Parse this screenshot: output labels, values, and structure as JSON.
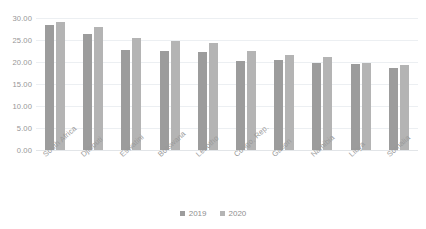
{
  "chart_data": {
    "type": "bar",
    "title": "",
    "xlabel": "",
    "ylabel": "",
    "ylim": [
      0,
      30
    ],
    "ytick_labels": [
      "30.00",
      "25.00",
      "20.00",
      "15.00",
      "10.00",
      "5.00",
      "0.00"
    ],
    "yticks": [
      30,
      25,
      20,
      15,
      10,
      5,
      0
    ],
    "grid": true,
    "legend_position": "bottom",
    "categories": [
      "South Africa",
      "Djibouti",
      "Eswatini",
      "Botswana",
      "Lesotho",
      "Congo, Rep.",
      "Gabon",
      "Namibia",
      "Libya",
      "Somalia"
    ],
    "series": [
      {
        "name": "2019",
        "color": "#9c9c9c",
        "values": [
          28.3,
          26.3,
          22.7,
          22.4,
          22.2,
          20.3,
          20.5,
          19.8,
          19.5,
          18.6
        ]
      },
      {
        "name": "2020",
        "color": "#b4b4b4",
        "values": [
          29.1,
          28.0,
          25.4,
          24.8,
          24.4,
          22.6,
          21.7,
          21.1,
          19.7,
          19.4
        ]
      }
    ]
  },
  "legend": {
    "items": [
      {
        "label": "2019"
      },
      {
        "label": "2020"
      }
    ]
  },
  "colors": {
    "series_2019": "#9c9c9c",
    "series_2020": "#b4b4b4",
    "gridline": "#eceff2",
    "axis_text": "#969696",
    "background": "#ffffff"
  }
}
